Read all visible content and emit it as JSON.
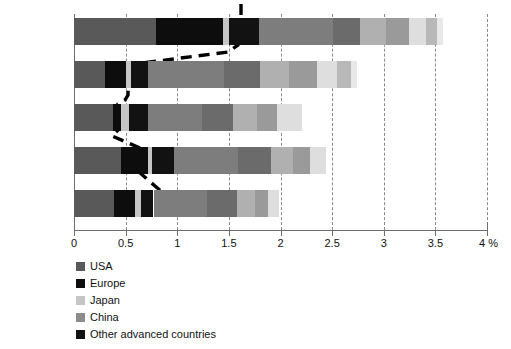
{
  "chart_data": {
    "type": "bar",
    "orientation": "horizontal",
    "stacked": true,
    "title": "",
    "subtitle": "",
    "xlabel": "4 %",
    "ylabel": "",
    "xlim": [
      0,
      4
    ],
    "grid": true,
    "grid_style": "dashed vertical",
    "legend_position": "below-left",
    "xticks": [
      "0",
      "0.5",
      "1",
      "1.5",
      "2",
      "2.5",
      "3",
      "3.5",
      "4 %"
    ],
    "xtick_values": [
      0,
      0.5,
      1,
      1.5,
      2,
      2.5,
      3,
      3.5,
      4
    ],
    "categories": [
      "1996–2005",
      "2006–2012",
      "2013",
      "2014–2018*",
      "2019–2025*"
    ],
    "series": [
      {
        "name": "USA",
        "color": "#595959",
        "values": [
          0.79,
          0.3,
          0.38,
          0.46,
          0.39
        ]
      },
      {
        "name": "Europe",
        "color": "#0d0d0d",
        "values": [
          0.65,
          0.2,
          0.08,
          0.26,
          0.2
        ]
      },
      {
        "name": "Japan",
        "color": "#c6c6c6",
        "values": [
          0.06,
          0.05,
          0.07,
          0.04,
          0.06
        ]
      },
      {
        "name": "China",
        "color": "#8c8c8c",
        "values": [
          0.0,
          0.0,
          0.0,
          0.0,
          0.0
        ]
      },
      {
        "name": "Other advanced countries",
        "color": "#121212",
        "values": [
          0.29,
          0.17,
          0.19,
          0.21,
          0.12
        ]
      },
      {
        "name": "rest-1",
        "color": "#7d7d7d",
        "values": [
          0.72,
          0.73,
          0.52,
          0.62,
          0.52
        ]
      },
      {
        "name": "rest-2",
        "color": "#6b6b6b",
        "values": [
          0.26,
          0.35,
          0.3,
          0.32,
          0.29
        ]
      },
      {
        "name": "rest-3",
        "color": "#b0b0b0",
        "values": [
          0.25,
          0.28,
          0.23,
          0.21,
          0.17
        ]
      },
      {
        "name": "rest-4",
        "color": "#9a9a9a",
        "values": [
          0.22,
          0.27,
          0.2,
          0.17,
          0.13
        ]
      },
      {
        "name": "rest-5",
        "color": "#dedede",
        "values": [
          0.17,
          0.2,
          0.24,
          0.15,
          0.11
        ]
      },
      {
        "name": "rest-6",
        "color": "#b8b8b8",
        "values": [
          0.11,
          0.13,
          0.0,
          0.0,
          0.0
        ]
      },
      {
        "name": "rest-7",
        "color": "#e8e8e8",
        "values": [
          0.05,
          0.06,
          0.0,
          0.0,
          0.0
        ]
      }
    ],
    "totals": [
      3.57,
      3.52,
      2.98,
      2.79,
      2.52
    ],
    "annotations": {
      "trend_line": {
        "style": "thick dashed black",
        "description": "dashed line descending from ~1.6 at 1996–2005 down to ~0.55 at 2019–2025"
      },
      "footnote_marker": "*"
    }
  },
  "legend": {
    "items": [
      {
        "label": "USA",
        "color": "#595959"
      },
      {
        "label": "Europe",
        "color": "#0d0d0d"
      },
      {
        "label": "Japan",
        "color": "#c6c6c6"
      },
      {
        "label": "China",
        "color": "#8c8c8c"
      },
      {
        "label": "Other advanced countries",
        "color": "#121212"
      }
    ]
  }
}
